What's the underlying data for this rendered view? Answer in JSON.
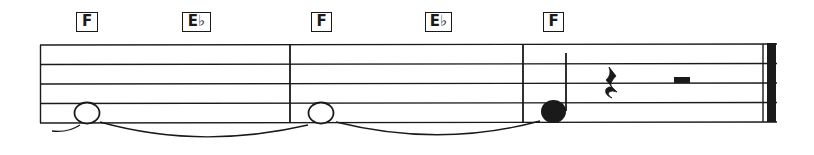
{
  "score": {
    "measures": [
      {
        "chords": [
          "F",
          "E♭"
        ],
        "notes": [
          {
            "type": "whole",
            "pitch": "F4",
            "tied_from_previous": true,
            "tied_to_next": true
          }
        ]
      },
      {
        "chords": [
          "F",
          "E♭"
        ],
        "notes": [
          {
            "type": "whole",
            "pitch": "F4",
            "tied_from_previous": true,
            "tied_to_next": true
          }
        ]
      },
      {
        "chords": [
          "F"
        ],
        "notes": [
          {
            "type": "quarter",
            "pitch": "F4",
            "tied_from_previous": true
          },
          {
            "type": "quarter-rest"
          },
          {
            "type": "half-rest"
          }
        ]
      }
    ],
    "final_barline": "end"
  },
  "colors": {
    "ink": "#1a1a1a",
    "background": "#ffffff"
  }
}
